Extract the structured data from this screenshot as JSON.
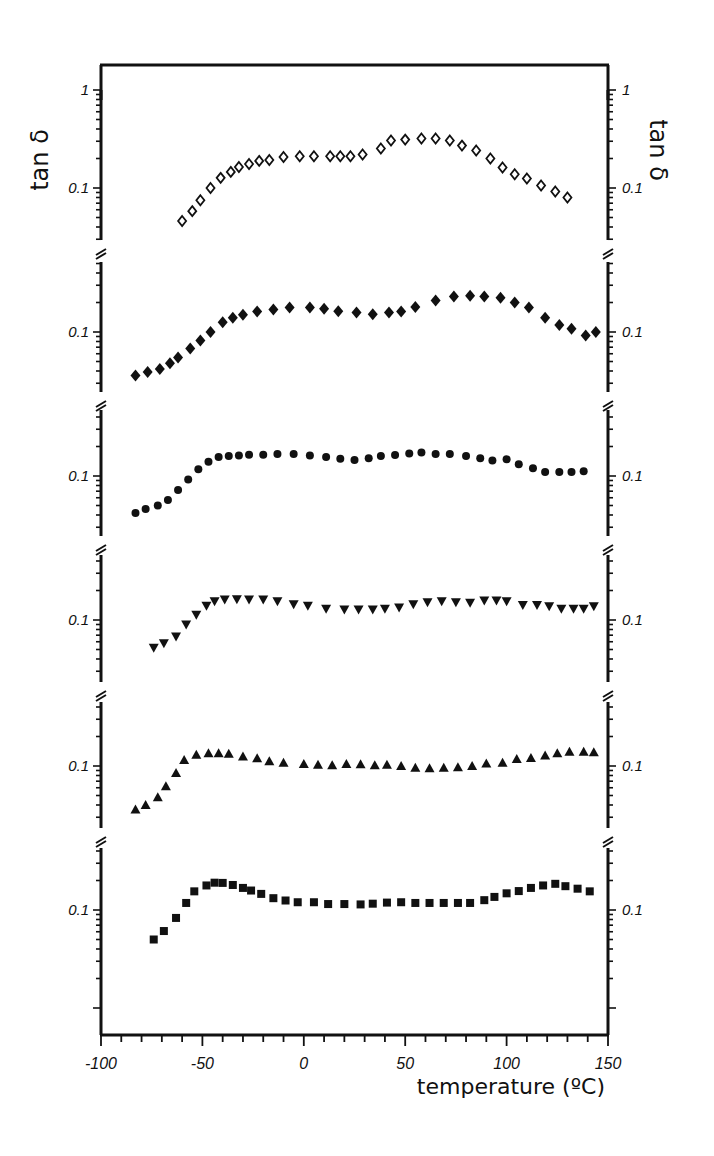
{
  "chart_data": {
    "type": "scatter",
    "title": "",
    "xlabel": "temperature (ºC)",
    "ylabel": "tan δ",
    "ylabel_right": "tan δ",
    "xlim": [
      -100,
      150
    ],
    "x_ticks": [
      -100,
      -50,
      0,
      50,
      100,
      150
    ],
    "x_tick_labels": [
      "-100",
      "-50",
      "0",
      "50",
      "100",
      "150"
    ],
    "y_scale": "log",
    "layout": "six vertically stacked log-scale panels sharing the temperature axis, separated by axis breaks (≈)",
    "grid": false,
    "legend": null,
    "panels": [
      {
        "marker": "open-diamond",
        "y_tick_labels": [
          "1",
          "0.1"
        ],
        "series": {
          "x": [
            -60,
            -55,
            -51,
            -46,
            -41,
            -36,
            -32,
            -27,
            -22,
            -17,
            -10,
            -2,
            5,
            13,
            18,
            23,
            29,
            38,
            43,
            50,
            58,
            65,
            72,
            78,
            85,
            92,
            98,
            104,
            110,
            117,
            124,
            130
          ],
          "y": [
            0.046,
            0.058,
            0.075,
            0.1,
            0.127,
            0.146,
            0.164,
            0.176,
            0.189,
            0.193,
            0.207,
            0.211,
            0.211,
            0.211,
            0.211,
            0.211,
            0.22,
            0.253,
            0.305,
            0.312,
            0.32,
            0.32,
            0.305,
            0.271,
            0.241,
            0.2,
            0.162,
            0.138,
            0.125,
            0.106,
            0.092,
            0.08
          ]
        }
      },
      {
        "marker": "filled-diamond",
        "y_tick_labels": [
          "1",
          "0.1"
        ],
        "series": {
          "x": [
            -83,
            -77,
            -71,
            -66,
            -62,
            -56,
            -51,
            -46,
            -40,
            -35,
            -30,
            -23,
            -15,
            -7,
            3,
            10,
            17,
            26,
            34,
            42,
            48,
            55,
            65,
            74,
            82,
            89,
            97,
            104,
            111,
            119,
            126,
            132,
            139,
            144
          ],
          "y": [
            0.036,
            0.039,
            0.042,
            0.048,
            0.055,
            0.068,
            0.082,
            0.1,
            0.126,
            0.14,
            0.15,
            0.162,
            0.17,
            0.178,
            0.178,
            0.173,
            0.163,
            0.158,
            0.152,
            0.158,
            0.162,
            0.18,
            0.21,
            0.23,
            0.235,
            0.23,
            0.223,
            0.2,
            0.178,
            0.14,
            0.118,
            0.108,
            0.092,
            0.1
          ]
        }
      },
      {
        "marker": "filled-circle",
        "y_tick_labels": [
          "1",
          "0.1"
        ],
        "series": {
          "x": [
            -83,
            -78,
            -72,
            -67,
            -62,
            -57,
            -52,
            -47,
            -42,
            -37,
            -32,
            -27,
            -20,
            -13,
            -5,
            3,
            11,
            18,
            25,
            32,
            38,
            45,
            52,
            58,
            65,
            72,
            80,
            87,
            93,
            100,
            106,
            113,
            119,
            126,
            132,
            138
          ],
          "y": [
            0.042,
            0.046,
            0.05,
            0.057,
            0.072,
            0.092,
            0.117,
            0.14,
            0.156,
            0.16,
            0.162,
            0.165,
            0.165,
            0.168,
            0.168,
            0.162,
            0.156,
            0.15,
            0.146,
            0.152,
            0.16,
            0.164,
            0.17,
            0.174,
            0.168,
            0.168,
            0.16,
            0.152,
            0.144,
            0.148,
            0.132,
            0.12,
            0.11,
            0.11,
            0.11,
            0.112
          ]
        }
      },
      {
        "marker": "filled-down-triangle",
        "y_tick_labels": [
          "1",
          "0.1"
        ],
        "series": {
          "x": [
            -74,
            -69,
            -63,
            -58,
            -53,
            -48,
            -44,
            -39,
            -33,
            -27,
            -20,
            -13,
            -5,
            2,
            11,
            20,
            27,
            34,
            40,
            47,
            54,
            61,
            68,
            75,
            82,
            89,
            95,
            100,
            108,
            115,
            121,
            127,
            133,
            138,
            143
          ],
          "y": [
            0.052,
            0.058,
            0.068,
            0.09,
            0.113,
            0.14,
            0.155,
            0.162,
            0.163,
            0.162,
            0.162,
            0.155,
            0.145,
            0.14,
            0.13,
            0.128,
            0.128,
            0.128,
            0.13,
            0.134,
            0.145,
            0.152,
            0.155,
            0.152,
            0.15,
            0.158,
            0.158,
            0.155,
            0.142,
            0.142,
            0.138,
            0.13,
            0.13,
            0.13,
            0.138
          ]
        }
      },
      {
        "marker": "filled-up-triangle",
        "y_tick_labels": [
          "1",
          "0.1"
        ],
        "series": {
          "x": [
            -83,
            -78,
            -72,
            -68,
            -63,
            -59,
            -53,
            -47,
            -42,
            -37,
            -30,
            -23,
            -17,
            -10,
            0,
            7,
            14,
            21,
            28,
            35,
            41,
            48,
            55,
            62,
            69,
            76,
            83,
            90,
            98,
            105,
            112,
            119,
            125,
            131,
            138,
            143
          ],
          "y": [
            0.036,
            0.04,
            0.048,
            0.062,
            0.085,
            0.115,
            0.13,
            0.135,
            0.135,
            0.133,
            0.125,
            0.12,
            0.112,
            0.108,
            0.105,
            0.103,
            0.102,
            0.105,
            0.104,
            0.102,
            0.103,
            0.1,
            0.096,
            0.095,
            0.096,
            0.097,
            0.1,
            0.106,
            0.108,
            0.118,
            0.121,
            0.128,
            0.135,
            0.14,
            0.14,
            0.138
          ]
        }
      },
      {
        "marker": "filled-square",
        "y_tick_labels": [
          "1",
          "0.1"
        ],
        "series": {
          "x": [
            -74,
            -69,
            -63,
            -58,
            -54,
            -48,
            -44,
            -40,
            -35,
            -30,
            -26,
            -21,
            -15,
            -9,
            -3,
            5,
            12,
            20,
            28,
            34,
            41,
            48,
            55,
            62,
            69,
            76,
            82,
            89,
            94,
            100,
            106,
            112,
            118,
            124,
            129,
            135,
            141
          ],
          "y": [
            0.05,
            0.061,
            0.083,
            0.118,
            0.155,
            0.178,
            0.19,
            0.189,
            0.18,
            0.168,
            0.158,
            0.146,
            0.132,
            0.125,
            0.12,
            0.12,
            0.115,
            0.115,
            0.114,
            0.116,
            0.119,
            0.12,
            0.118,
            0.118,
            0.118,
            0.118,
            0.118,
            0.126,
            0.136,
            0.148,
            0.156,
            0.168,
            0.178,
            0.185,
            0.175,
            0.165,
            0.155
          ]
        }
      }
    ]
  }
}
